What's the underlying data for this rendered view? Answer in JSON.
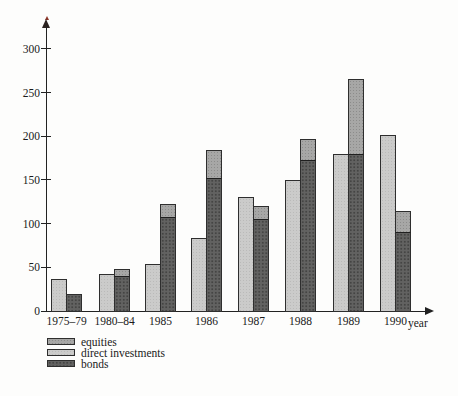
{
  "chart_data": {
    "type": "bar",
    "title": "",
    "xlabel": "year",
    "ylabel": "",
    "ylim": [
      0,
      300
    ],
    "yticks": [
      0,
      50,
      100,
      150,
      200,
      250,
      300
    ],
    "categories": [
      "1975–79",
      "1980–84",
      "1985",
      "1986",
      "1987",
      "1988",
      "1989",
      "1990"
    ],
    "layout_note": "each category has two bars: left = direct investments (single), right = stacked bonds (bottom) + equities (top)",
    "grid": false,
    "legend_position": "bottom-left",
    "series": [
      {
        "name": "equities",
        "role": "stacked-top",
        "color": "#a7a7a6",
        "values": [
          0,
          8,
          15,
          32,
          15,
          24,
          85,
          24
        ]
      },
      {
        "name": "direct investments",
        "role": "single-left-bar",
        "color": "#cbcbca",
        "values": [
          37,
          42,
          54,
          84,
          130,
          150,
          180,
          201
        ]
      },
      {
        "name": "bonds",
        "role": "stacked-bottom",
        "color": "#626261",
        "values": [
          20,
          40,
          107,
          152,
          105,
          173,
          180,
          90
        ]
      }
    ],
    "stacked_bar_totals": [
      20,
      48,
      122,
      184,
      120,
      197,
      265,
      114
    ]
  },
  "legend": {
    "items": [
      "equities",
      "direct investments",
      "bonds"
    ]
  }
}
